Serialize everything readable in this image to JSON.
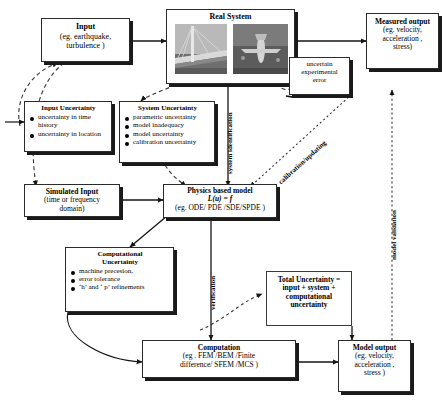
{
  "diagram": {
    "nodes": {
      "input": {
        "title": "Input",
        "sub1": "(eg. earthquake,",
        "sub2": "turbulence  )"
      },
      "real_system": {
        "title": "Real System",
        "photo_left": "suspension-bridge-photo",
        "photo_right": "aircraft-photo"
      },
      "measured_output": {
        "title": "Measured output",
        "sub1": "(eg. velocity,",
        "sub2": "acceleration ,",
        "sub3": "stress)"
      },
      "input_uncertainty": {
        "title": "Input Uncertainty",
        "bullets": [
          "uncertainty in time history",
          "uncertainty in   location"
        ]
      },
      "system_uncertainty": {
        "title": "System Uncertainty",
        "bullets": [
          "parametric uncertainty",
          "model inadequacy",
          "model uncertainty",
          "calibration uncertainty"
        ]
      },
      "experimental_error": {
        "line1": "uncertain",
        "line2": "experimental",
        "line3": "error"
      },
      "simulated_input": {
        "title": "Simulated Input",
        "sub1": "(time or frequency",
        "sub2": "domain)"
      },
      "physics_model": {
        "title": "Physics based model",
        "equation": "L(u) = f",
        "sub": "(eg. ODE/ PDE /SDE/SPDE )"
      },
      "computational_uncertainty": {
        "title1": "Computational",
        "title2": "Uncertainty",
        "bullets": [
          "machine precesion,",
          "error tolerance",
          "‘h’ and ‘ p’ refinements"
        ]
      },
      "total_uncertainty": {
        "line1": "Total Uncertainty =",
        "line2": "input + system +",
        "line3": "computational",
        "line4": "uncertainty"
      },
      "computation": {
        "title": "Computation",
        "sub1": "(eg . FEM /BEM /Finite",
        "sub2": "difference/  SFEM /MCS )"
      },
      "model_output": {
        "title": "Model output",
        "sub1": "(eg. velocity,",
        "sub2": "acceleration ,",
        "sub3": "stress )"
      }
    },
    "edge_labels": {
      "system_identification": "system identification",
      "calibration_updating": "calibration/updating",
      "verification": "verification",
      "model_validation": "model validation"
    },
    "colors": {
      "stroke": "#2b2b2b",
      "shadow": "#1a1a1a",
      "background": "#ffffff",
      "photo_gray": "#8b8b8b"
    }
  }
}
